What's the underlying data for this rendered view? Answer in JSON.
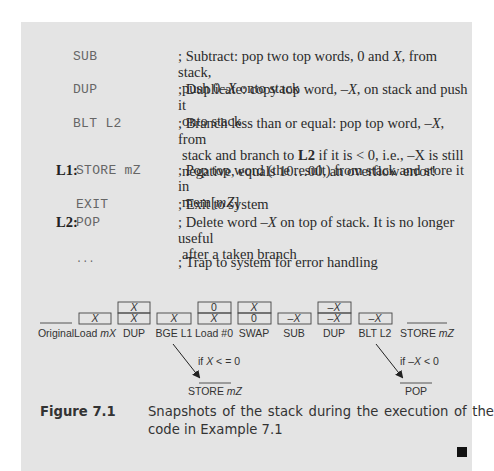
{
  "listing": [
    {
      "label": "",
      "code": "SUB",
      "comment_parts": [
        "; Subtract: pop two top words, 0 and ",
        "X",
        ", from stack,"
      ],
      "comment_line2": [
        "push 0–",
        "X",
        " onto stack"
      ]
    },
    {
      "label": "",
      "code": "DUP",
      "comment_parts": [
        "; Duplicate: copy top word, –",
        "X",
        ", on stack and push it"
      ],
      "comment_line2": [
        "onto stack",
        "",
        ""
      ]
    },
    {
      "label": "",
      "code": "BLT L2",
      "comment_parts": [
        "; Branch less than or equal: pop top word, –",
        "X",
        ", from"
      ],
      "comment_line2": [
        "stack and branch to ",
        "L2",
        " if it is < 0, i.e., –X is still"
      ],
      "comment_line3": "negative, equals 10…00, an overflow error!"
    },
    {
      "label": "L1:",
      "code": "STORE mZ",
      "comment_parts": [
        "; Pop top word (the result) from stack and store it in",
        "",
        ""
      ],
      "comment_line2": [
        "mem[",
        "mZ",
        "]"
      ]
    },
    {
      "label": "",
      "code": "EXIT",
      "comment_parts": [
        "; Exit to system",
        "",
        ""
      ]
    },
    {
      "label": "L2:",
      "code": "POP",
      "comment_parts": [
        "; Delete word –",
        "X",
        " on top of stack. It is no longer useful"
      ],
      "comment_line2": [
        "after a taken branch",
        "",
        ""
      ]
    },
    {
      "label": "",
      "code": "...",
      "comment_parts": [
        "; Trap to system for error handling",
        "",
        ""
      ]
    }
  ],
  "diagram": {
    "snapshots": [
      {
        "name": "Original",
        "stack": []
      },
      {
        "name": "Load mX",
        "stack": [
          "X"
        ]
      },
      {
        "name": "DUP",
        "stack": [
          "X",
          "X"
        ]
      },
      {
        "name": "BGE L1",
        "stack": [
          "X"
        ]
      },
      {
        "name": "Load #0",
        "stack": [
          "X",
          "0"
        ]
      },
      {
        "name": "SWAP",
        "stack": [
          "0",
          "X"
        ]
      },
      {
        "name": "SUB",
        "stack": [
          "–X"
        ]
      },
      {
        "name": "DUP",
        "stack": [
          "–X",
          "–X"
        ]
      },
      {
        "name": "BLT L2",
        "stack": [
          "–X"
        ]
      },
      {
        "name": "STORE mZ",
        "stack": []
      }
    ],
    "labels": {
      "original": "Original",
      "load_mx_a": "Load ",
      "load_mx_b": "mX",
      "dup1": "DUP",
      "bge": "BGE L1",
      "load0": "Load #0",
      "swap": "SWAP",
      "sub": "SUB",
      "dup2": "DUP",
      "blt": "BLT L2",
      "store_a": "STORE ",
      "store_b": "mZ",
      "cell_x": "X",
      "cell_0": "0",
      "cell_negx": "–X"
    },
    "branches": [
      {
        "condition_a": "if ",
        "condition_var": "X",
        "condition_b": " < = 0",
        "target_a": "STORE ",
        "target_b": "mZ"
      },
      {
        "condition_a": "if –",
        "condition_var": "X",
        "condition_b": " < 0",
        "target_a": "POP",
        "target_b": ""
      }
    ]
  },
  "caption": {
    "figure_label": "Figure 7.1",
    "text": "Snapshots of the stack during the execution of the code in Example 7.1"
  }
}
